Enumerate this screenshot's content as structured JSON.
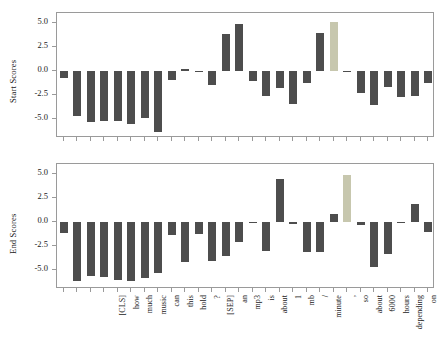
{
  "chart_data": {
    "type": "bar",
    "title": "",
    "subtitle": "",
    "panels": [
      {
        "name": "start-scores",
        "ylabel": "Start Scores",
        "xlabel": "",
        "ylim": [
          -7.0,
          6.0
        ],
        "yticks": [
          5.0,
          2.5,
          0.0,
          -2.5,
          -5.0
        ],
        "ytick_labels": [
          "5.0",
          "2.5",
          "0.0",
          "-2.5",
          "-5.0"
        ],
        "grid": false,
        "legend": "none",
        "categories": [
          "[CLS]",
          "how",
          "much",
          "music",
          "can",
          "this",
          "hold",
          "?",
          "[SEP]",
          "an",
          "mp3",
          "is",
          "about",
          "1",
          "mb",
          "/",
          "minute",
          ",",
          "so",
          "about",
          "6000",
          "hours",
          "depending",
          "on",
          "file",
          "size",
          ".",
          "[SEP]"
        ],
        "values": [
          -0.8,
          -4.7,
          -5.3,
          -5.2,
          -5.2,
          -5.5,
          -4.9,
          -6.4,
          -1.0,
          0.2,
          -0.1,
          -1.5,
          3.8,
          4.9,
          -1.1,
          -2.6,
          -1.8,
          -3.5,
          -1.3,
          3.9,
          5.1,
          -0.1,
          -2.3,
          -3.6,
          -1.7,
          -2.7,
          -2.6,
          -1.3
        ],
        "highlight_index": 20,
        "highlight_label": "hours"
      },
      {
        "name": "end-scores",
        "ylabel": "End Scores",
        "xlabel": "",
        "ylim": [
          -7.0,
          6.0
        ],
        "yticks": [
          5.0,
          2.5,
          0.0,
          -2.5,
          -5.0
        ],
        "ytick_labels": [
          "5.0",
          "2.5",
          "0.0",
          "-2.5",
          "-5.0"
        ],
        "grid": false,
        "legend": "none",
        "categories": [
          "[CLS]",
          "how",
          "much",
          "music",
          "can",
          "this",
          "hold",
          "?",
          "[SEP]",
          "an",
          "mp3",
          "is",
          "about",
          "1",
          "mb",
          "/",
          "minute",
          ",",
          "so",
          "about",
          "6000",
          "hours",
          "depending",
          "on",
          "file",
          "size",
          ".",
          "[SEP]"
        ],
        "values": [
          -1.2,
          -6.2,
          -5.7,
          -5.8,
          -6.1,
          -6.2,
          -5.9,
          -5.3,
          -1.4,
          -4.2,
          -1.3,
          -4.1,
          -3.6,
          -2.1,
          -0.1,
          -3.0,
          4.4,
          -0.2,
          -3.2,
          -3.2,
          0.8,
          4.9,
          -0.3,
          -4.7,
          -3.4,
          -0.1,
          1.8,
          -1.1
        ],
        "highlight_index": 21,
        "highlight_label": "hours"
      }
    ],
    "colors": {
      "bar": "#4d4d4d",
      "highlight": "#c7c7ae",
      "axis": "#9a9a9a",
      "text": "#1a1a1a",
      "background": "#ffffff"
    }
  }
}
